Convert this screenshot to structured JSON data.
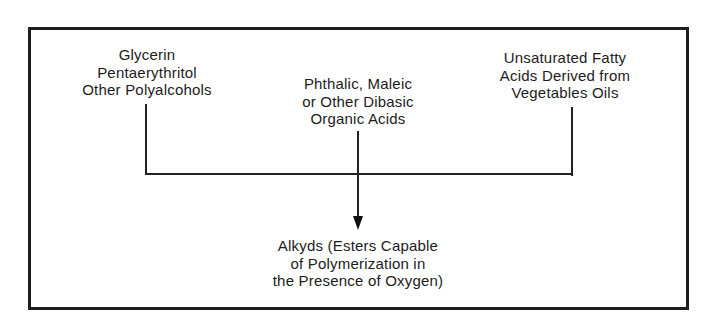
{
  "diagram": {
    "inputs": [
      {
        "id": "polyalcohols",
        "lines": [
          "Glycerin",
          "Pentaerythritol",
          "Other Polyalcohols"
        ]
      },
      {
        "id": "dibasic-acids",
        "lines": [
          "Phthalic, Maleic",
          "or Other Dibasic",
          "Organic Acids"
        ]
      },
      {
        "id": "fatty-acids",
        "lines": [
          "Unsaturated Fatty",
          "Acids Derived from",
          "Vegetables Oils"
        ]
      }
    ],
    "output": {
      "id": "alkyds",
      "lines": [
        "Alkyds (Esters Capable",
        "of Polymerization in",
        "the Presence of Oxygen)"
      ]
    },
    "edges": [
      {
        "from": "polyalcohols",
        "to": "alkyds"
      },
      {
        "from": "dibasic-acids",
        "to": "alkyds"
      },
      {
        "from": "fatty-acids",
        "to": "alkyds"
      }
    ],
    "colors": {
      "line": "#222222",
      "text": "#1c1c1c",
      "background": "#ffffff"
    }
  }
}
